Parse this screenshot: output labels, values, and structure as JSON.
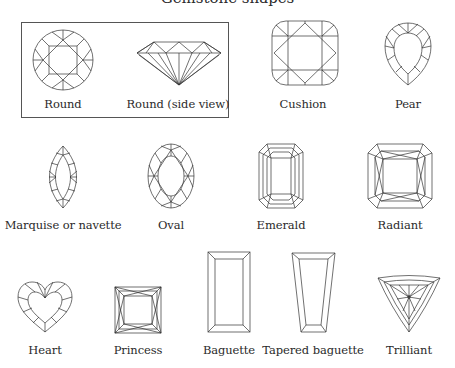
{
  "title": "Gemstone shapes",
  "shapes": [
    {
      "label": "Round"
    },
    {
      "label": "Round (side view)"
    },
    {
      "label": "Cushion"
    },
    {
      "label": "Pear"
    },
    {
      "label": "Marquise or navette"
    },
    {
      "label": "Oval"
    },
    {
      "label": "Emerald"
    },
    {
      "label": "Radiant"
    },
    {
      "label": "Heart"
    },
    {
      "label": "Princess"
    },
    {
      "label": "Baguette"
    },
    {
      "label": "Tapered baguette"
    },
    {
      "label": "Trilliant"
    }
  ]
}
